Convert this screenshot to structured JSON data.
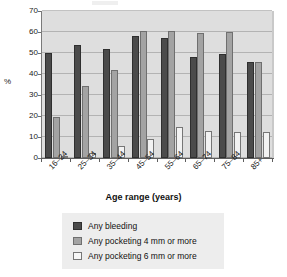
{
  "chart_data": {
    "type": "bar",
    "title": "",
    "subtitle": "",
    "xlabel": "Age range (years)",
    "ylabel": "%",
    "categories": [
      "16–24",
      "25–34",
      "35–44",
      "45–54",
      "55–64",
      "65–74",
      "75–84",
      "85+"
    ],
    "series": [
      {
        "name": "Any bleeding",
        "color": "#4b4b4b",
        "values": [
          50,
          54,
          52,
          58,
          57,
          48,
          49.5,
          45.5
        ]
      },
      {
        "name": "Any pocketing 4 mm or more",
        "color": "#a3a3a3",
        "values": [
          19.5,
          34.5,
          42,
          60.5,
          60.5,
          59.5,
          60,
          45.5
        ]
      },
      {
        "name": "Any pocketing 6 mm or more",
        "color": "#f2f2f2",
        "values": [
          1,
          2.5,
          5.5,
          9,
          15,
          13,
          12.5,
          12.5
        ]
      }
    ],
    "ylim": [
      0,
      70
    ],
    "yticks": [
      0,
      10,
      20,
      30,
      40,
      50,
      60,
      70
    ],
    "ytick_labels": [
      "0",
      "10",
      "20",
      "30",
      "40",
      "50",
      "60",
      "70"
    ],
    "grid": true,
    "legend_position": "bottom",
    "plot_background": "#dedede"
  },
  "legend": {
    "items": [
      {
        "label": "Any bleeding"
      },
      {
        "label": "Any pocketing 4 mm or more"
      },
      {
        "label": "Any pocketing 6 mm or more"
      }
    ]
  }
}
